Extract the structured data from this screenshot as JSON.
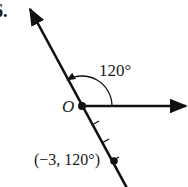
{
  "problem": {
    "number_label": "6."
  },
  "diagram": {
    "type": "polar-coordinate-plot",
    "origin_label": "O",
    "angle_label": "120°",
    "point_label": "(−3, 120°)",
    "point": {
      "r": -3,
      "theta_deg": 120
    },
    "tick_marks_count": 3,
    "colors": {
      "ink": "#111111",
      "background": "#ffffff"
    }
  }
}
